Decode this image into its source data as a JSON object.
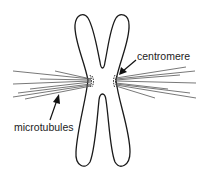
{
  "diagram": {
    "labels": {
      "centromere": "centromere",
      "microtubules": "microtubules"
    },
    "colors": {
      "outline": "#1a1a1a",
      "microtubule": "#555555",
      "text": "#222222",
      "background": "#ffffff"
    }
  }
}
